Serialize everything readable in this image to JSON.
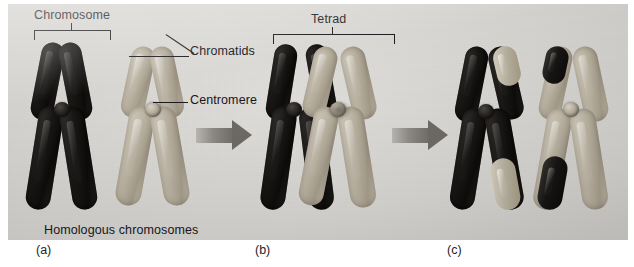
{
  "figure": {
    "background_color": "#d7d5d1",
    "plate_border_color": "#ffffff"
  },
  "annotations": {
    "chromosome": "Chromosome",
    "chromatids": "Chromatids",
    "centromere": "Centromere",
    "tetrad": "Tetrad",
    "homologous": "Homologous chromosomes"
  },
  "panels": [
    {
      "key": "a",
      "label": "(a)",
      "caption": "Homologous chromosomes",
      "stage": "Two homologous chromosomes, each with two sister chromatids"
    },
    {
      "key": "b",
      "label": "(b)",
      "caption": "Tetrad",
      "stage": "Homologues pair to form a tetrad; non-sister chromatids cross over"
    },
    {
      "key": "c",
      "label": "(c)",
      "caption": "",
      "stage": "Recombinant chromosomes after segment exchange"
    }
  ],
  "colors": {
    "dark_chromosome": "#141210",
    "light_chromosome": "#b5ad9c",
    "centromere": "#b3aa99",
    "arrow": "#6f6c68",
    "label_text": "#17161a"
  },
  "arrows": [
    {
      "name": "arrow-a-to-b",
      "from": "a",
      "to": "b"
    },
    {
      "name": "arrow-b-to-c",
      "from": "b",
      "to": "c"
    }
  ]
}
